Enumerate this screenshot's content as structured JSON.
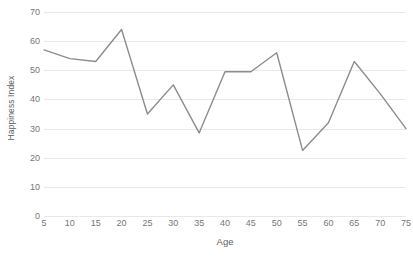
{
  "chart_data": {
    "type": "line",
    "title": "",
    "xlabel": "Age",
    "ylabel": "Happiness Index",
    "x": [
      5,
      10,
      15,
      20,
      25,
      30,
      35,
      40,
      45,
      50,
      55,
      60,
      65,
      70,
      75
    ],
    "values": [
      57,
      54,
      53,
      64,
      35,
      45,
      28.5,
      49.5,
      49.5,
      56,
      22.5,
      32,
      53,
      42,
      30
    ],
    "series": [
      {
        "name": "Happiness Index",
        "values": [
          57,
          54,
          53,
          64,
          35,
          45,
          28.5,
          49.5,
          49.5,
          56,
          22.5,
          32,
          53,
          42,
          30
        ]
      }
    ],
    "x_tick_labels": [
      "5",
      "10",
      "15",
      "20",
      "25",
      "30",
      "35",
      "40",
      "45",
      "50",
      "55",
      "60",
      "65",
      "70",
      "75"
    ],
    "y_tick_labels": [
      "0",
      "10",
      "20",
      "30",
      "40",
      "50",
      "60",
      "70"
    ],
    "y_ticks": [
      0,
      10,
      20,
      30,
      40,
      50,
      60,
      70
    ],
    "xlim": [
      5,
      75
    ],
    "ylim": [
      0,
      70
    ],
    "grid": true,
    "grid_axis": "y",
    "legend": false,
    "legend_position": "none",
    "line_color": "#8c8c8c",
    "grid_color": "#e8e8e8",
    "text_color": "#767676",
    "background_color": "#ffffff"
  }
}
